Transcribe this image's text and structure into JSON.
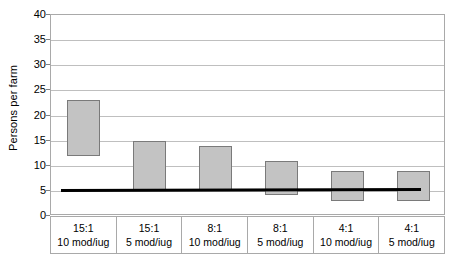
{
  "chart_data": {
    "type": "bar",
    "bar_style": "floating-range",
    "title": "",
    "subtitle": "",
    "xlabel": "",
    "ylabel": "Persons per farm",
    "ylim": [
      0,
      40
    ],
    "ytick_step": 5,
    "yticks": [
      0,
      5,
      10,
      15,
      20,
      25,
      30,
      35,
      40
    ],
    "ytick_labels": [
      "0",
      "5",
      "10",
      "15",
      "20",
      "25",
      "30",
      "35",
      "40"
    ],
    "grid": true,
    "grid_axis": "y",
    "legend": false,
    "legend_position": "none",
    "categories": [
      "15:1 10 mod/iug",
      "15:1 5 mod/iug",
      "8:1 10 mod/iug",
      "8:1 5 mod/iug",
      "4:1 10 mod/iug",
      "4:1 5 mod/iug"
    ],
    "category_lines": [
      {
        "line1": "15:1",
        "line2": "10 mod/iug"
      },
      {
        "line1": "15:1",
        "line2": "5 mod/iug"
      },
      {
        "line1": "8:1",
        "line2": "10 mod/iug"
      },
      {
        "line1": "8:1",
        "line2": "5 mod/iug"
      },
      {
        "line1": "4:1",
        "line2": "10 mod/iug"
      },
      {
        "line1": "4:1",
        "line2": "5 mod/iug"
      }
    ],
    "series": [
      {
        "name": "Persons per farm range",
        "low": [
          12,
          5,
          5,
          4.2,
          3,
          3
        ],
        "high": [
          23,
          15,
          14,
          11,
          9,
          9
        ]
      }
    ],
    "annotations": [
      {
        "type": "reference-line",
        "name": "threshold-line",
        "value_start": 5,
        "value_end": 5.2,
        "color": "#000000",
        "description": "Horizontal black reference line at approximately 5 persons per farm"
      }
    ],
    "colors": {
      "bar_fill": "#c3c3c3",
      "bar_border": "#7a7a7a",
      "gridline": "#bfbfbf",
      "frame": "#a9a9a9",
      "reference_line": "#000000",
      "text": "#000000",
      "background": "#ffffff"
    }
  }
}
